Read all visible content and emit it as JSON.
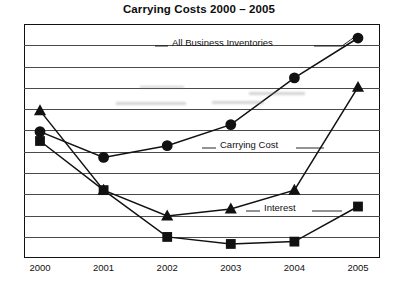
{
  "chart_data": {
    "type": "line",
    "title": "Carrying Costs 2000 – 2005",
    "xlabel": "",
    "ylabel": "",
    "grid": true,
    "gridline_count": 10,
    "legend_position": "inline-annotations",
    "axis_tick_labels_y": [],
    "categories": [
      "2000",
      "2001",
      "2002",
      "2003",
      "2004",
      "2005"
    ],
    "ylim": [
      0,
      100
    ],
    "series": [
      {
        "name": "All Business Inventories",
        "marker": "circle",
        "values": [
          54,
          43,
          48,
          57,
          77,
          94
        ]
      },
      {
        "name": "Carrying Cost",
        "marker": "triangle",
        "values": [
          63,
          29,
          18,
          21,
          29,
          73
        ]
      },
      {
        "name": "Interest",
        "marker": "square",
        "values": [
          50,
          29,
          9,
          6,
          7,
          22
        ]
      }
    ],
    "annotations": [
      {
        "text": "All Business Inventories",
        "series": "All Business Inventories"
      },
      {
        "text": "Carrying Cost",
        "series": "Carrying Cost"
      },
      {
        "text": "Interest",
        "series": "Interest"
      }
    ]
  },
  "axis": {
    "x_ticks": [
      "2000",
      "2001",
      "2002",
      "2003",
      "2004",
      "2005"
    ]
  },
  "labels": {
    "all_business_inventories": "All Business Inventories",
    "carrying_cost": "Carrying Cost",
    "interest": "Interest"
  },
  "colors": {
    "ink": "#111111",
    "grid": "#4a4a4a",
    "background": "#ffffff"
  }
}
